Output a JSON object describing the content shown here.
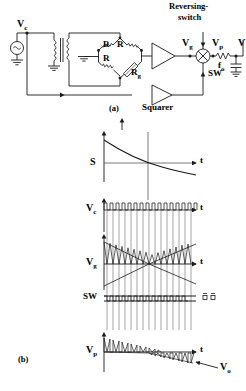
{
  "figure": {
    "caption_a": "(a)",
    "caption_b": "(b)",
    "type": "circuit-block-diagram-with-timing-waveforms"
  },
  "circuit": {
    "source_label": "V",
    "source_sub": "c",
    "source_icon": "ac-source-icon",
    "transformer": "transformer-icon",
    "bridge": {
      "resistors": [
        "R",
        "R",
        "R"
      ],
      "sensor_label": "R",
      "sensor_sub": "g",
      "ground_icon": "ground-icon"
    },
    "amplifier": "triangle-amplifier-icon",
    "node_vg_label": "V",
    "node_vg_sub": "g",
    "mixer_icon": "multiplier-circle-x-icon",
    "reversing_switch_line1": "Reversing-",
    "reversing_switch_line2": "switch",
    "node_vp_label": "V",
    "node_vp_sub": "p",
    "sw_label": "SW",
    "squarer_label": "Squarer",
    "filter_label": "f",
    "filter_sub": "o",
    "filter_resistor_icon": "resistor-zigzag-icon",
    "filter_capacitor_icon": "capacitor-icon",
    "output_label": "V"
  },
  "waveforms": [
    {
      "name": "S",
      "label": "S",
      "sub": "",
      "axis_label": "t",
      "description": "monotonically decaying curve",
      "type": "line"
    },
    {
      "name": "Vc",
      "label": "V",
      "sub": "c",
      "axis_label": "t",
      "description": "carrier square/pulse train, constant amplitude",
      "type": "pulse-train",
      "cycles": 15
    },
    {
      "name": "Vg",
      "label": "V",
      "sub": "g",
      "axis_label": "t",
      "description": "bowtie envelope: amplitude decreases to a null then increases, phase reverses",
      "type": "modulated-oscillation",
      "cycles": 15
    },
    {
      "name": "SW",
      "label": "SW",
      "sub": "",
      "axis_label": "",
      "description": "reversing switch drive, alternating level",
      "type": "square-wave"
    },
    {
      "name": "Vp",
      "label": "V",
      "sub": "p",
      "axis_label": "t",
      "description": "rectified product, decays to zero then goes negative",
      "type": "rectified-decay",
      "output_label": "V",
      "output_sub": "o"
    }
  ],
  "colors": {
    "stroke": "#1a1a1a",
    "background": "#ffffff"
  }
}
